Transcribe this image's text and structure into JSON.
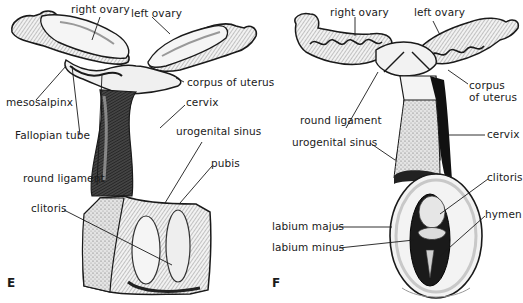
{
  "figure": {
    "panels": [
      {
        "id": "E",
        "letter": "E",
        "labels": {
          "right_ovary": "right ovary",
          "left_ovary": "left ovary",
          "corpus_of_uterus": "corpus of uterus",
          "mesosalpinx": "mesosalpinx",
          "cervix": "cervix",
          "fallopian_tube": "Fallopian tube",
          "urogenital_sinus": "urogenital sinus",
          "round_ligament": "round ligament",
          "pubis": "pubis",
          "clitoris": "clitoris"
        }
      },
      {
        "id": "F",
        "letter": "F",
        "labels": {
          "right_ovary": "right ovary",
          "left_ovary": "left ovary",
          "corpus_of_uterus_line1": "corpus",
          "corpus_of_uterus_line2": "of uterus",
          "round_ligament": "round ligament",
          "urogenital_sinus": "urogenital sinus",
          "cervix": "cervix",
          "clitoris": "clitoris",
          "hymen": "hymen",
          "labium_majus": "labium majus",
          "labium_minus": "labium minus"
        }
      }
    ],
    "colors": {
      "ink": "#1a1a1a",
      "shade": "#555555",
      "paper": "#ffffff",
      "light_fill": "#ececec"
    }
  }
}
